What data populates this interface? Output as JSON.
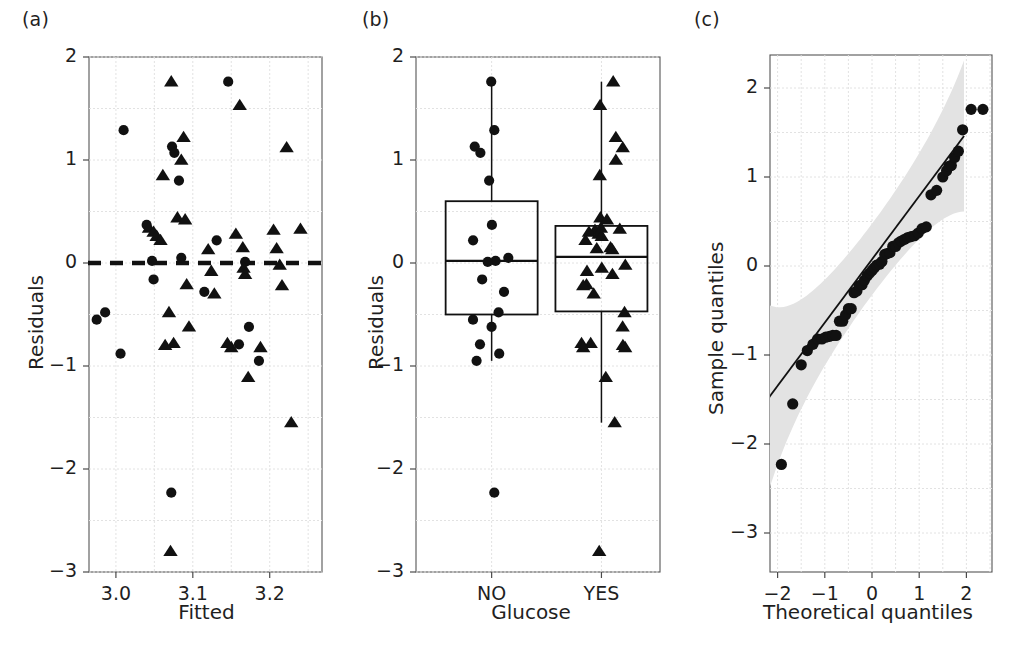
{
  "figure": {
    "background": "#ffffff",
    "marker_color": "#111111",
    "band_color": "#e3e3e3",
    "grid_color": "#e2e2e2",
    "axis_color": "#555555"
  },
  "panels": {
    "a": {
      "tag": "(a)",
      "xlabel": "Fitted",
      "ylabel": "Residuals"
    },
    "b": {
      "tag": "(b)",
      "xlabel": "Glucose",
      "ylabel": "Residuals"
    },
    "c": {
      "tag": "(c)",
      "xlabel": "Theoretical quantiles",
      "ylabel": "Sample quantiles"
    }
  },
  "chart_data": [
    {
      "id": "panel-a",
      "type": "scatter",
      "title": "(a)",
      "xlabel": "Fitted",
      "ylabel": "Residuals",
      "xlim": [
        2.965,
        3.268
      ],
      "ylim": [
        -3,
        2
      ],
      "xticks": [
        3.0,
        3.1,
        3.2
      ],
      "xtick_labels": [
        "3.0",
        "3.1",
        "3.2"
      ],
      "yticks": [
        -3,
        -2,
        -1,
        0,
        1,
        2
      ],
      "ytick_labels": [
        "-3",
        "-2",
        "-1",
        "0",
        "1",
        "2"
      ],
      "grid": true,
      "reference_line": {
        "type": "horizontal",
        "y": 0,
        "style": "dashed",
        "width": 4.5
      },
      "series": [
        {
          "name": "Glucose NO",
          "marker": "circle",
          "points": [
            [
              2.975,
              -0.55
            ],
            [
              2.986,
              -0.48
            ],
            [
              3.006,
              3.006
            ],
            [
              3.006,
              -0.88
            ],
            [
              3.01,
              1.29
            ],
            [
              3.04,
              0.37
            ],
            [
              3.047,
              0.02
            ],
            [
              3.049,
              -0.16
            ],
            [
              3.072,
              -2.23
            ],
            [
              3.073,
              1.13
            ],
            [
              3.076,
              1.07
            ],
            [
              3.082,
              0.8
            ],
            [
              3.085,
              0.05
            ],
            [
              3.115,
              -0.28
            ],
            [
              3.131,
              0.22
            ],
            [
              3.146,
              1.76
            ],
            [
              3.16,
              -0.79
            ],
            [
              3.168,
              0.01
            ],
            [
              3.173,
              -0.62
            ],
            [
              3.186,
              -0.95
            ]
          ]
        },
        {
          "name": "Glucose YES",
          "marker": "triangle",
          "points": [
            [
              3.043,
              0.34
            ],
            [
              3.049,
              0.3
            ],
            [
              3.053,
              0.26
            ],
            [
              3.058,
              0.22
            ],
            [
              3.061,
              0.85
            ],
            [
              3.064,
              -0.8
            ],
            [
              3.069,
              -0.48
            ],
            [
              3.071,
              -2.8
            ],
            [
              3.072,
              1.76
            ],
            [
              3.075,
              -0.78
            ],
            [
              3.08,
              0.44
            ],
            [
              3.085,
              1.0
            ],
            [
              3.088,
              1.22
            ],
            [
              3.09,
              0.42
            ],
            [
              3.092,
              -0.21
            ],
            [
              3.095,
              -0.62
            ],
            [
              3.12,
              0.13
            ],
            [
              3.124,
              -0.08
            ],
            [
              3.128,
              -0.3
            ],
            [
              3.145,
              -0.78
            ],
            [
              3.15,
              -0.82
            ],
            [
              3.156,
              0.28
            ],
            [
              3.161,
              1.53
            ],
            [
              3.165,
              0.15
            ],
            [
              3.166,
              -0.05
            ],
            [
              3.168,
              -0.11
            ],
            [
              3.172,
              -1.11
            ],
            [
              3.188,
              -0.82
            ],
            [
              3.205,
              0.32
            ],
            [
              3.209,
              0.14
            ],
            [
              3.213,
              -0.02
            ],
            [
              3.216,
              -0.22
            ],
            [
              3.222,
              1.12
            ],
            [
              3.228,
              -1.55
            ],
            [
              3.24,
              0.33
            ]
          ]
        }
      ]
    },
    {
      "id": "panel-b",
      "type": "boxplot",
      "title": "(b)",
      "xlabel": "Glucose",
      "ylabel": "Residuals",
      "ylim": [
        -3,
        2
      ],
      "yticks": [
        -3,
        -2,
        -1,
        0,
        1,
        2
      ],
      "ytick_labels": [
        "-3",
        "-2",
        "-1",
        "0",
        "1",
        "2"
      ],
      "categories": [
        "NO",
        "YES"
      ],
      "grid": true,
      "boxes": [
        {
          "category": "NO",
          "marker": "circle",
          "q1": -0.5,
          "median": 0.02,
          "q3": 0.6,
          "whisker_low": -0.95,
          "whisker_high": 1.76,
          "points": [
            1.76,
            1.29,
            1.13,
            1.07,
            0.8,
            0.37,
            0.22,
            0.05,
            0.02,
            0.01,
            -0.16,
            -0.28,
            -0.48,
            -0.55,
            -0.62,
            -0.79,
            -0.88,
            -0.95,
            -2.23
          ]
        },
        {
          "category": "YES",
          "marker": "triangle",
          "q1": -0.47,
          "median": 0.06,
          "q3": 0.36,
          "whisker_low": -1.55,
          "whisker_high": 1.76,
          "points": [
            1.76,
            1.53,
            1.22,
            1.12,
            1.0,
            0.85,
            0.44,
            0.42,
            0.34,
            0.33,
            0.32,
            0.3,
            0.28,
            0.26,
            0.22,
            0.15,
            0.14,
            0.13,
            -0.02,
            -0.05,
            -0.08,
            -0.11,
            -0.21,
            -0.22,
            -0.3,
            -0.48,
            -0.62,
            -0.78,
            -0.78,
            -0.8,
            -0.82,
            -0.82,
            -1.11,
            -1.55,
            -2.8
          ]
        }
      ]
    },
    {
      "id": "panel-c",
      "type": "scatter",
      "title": "(c)",
      "xlabel": "Theoretical quantiles",
      "ylabel": "Sample quantiles",
      "xlim": [
        -2.6,
        2.6
      ],
      "ylim": [
        -3,
        2.45
      ],
      "xticks": [
        -2,
        -1,
        0,
        1,
        2
      ],
      "xtick_labels": [
        "-2",
        "-1",
        "0",
        "1",
        "2"
      ],
      "yticks": [
        -3,
        -2,
        -1,
        0,
        1,
        2
      ],
      "ytick_labels": [
        "-3",
        "-2",
        "-1",
        "0",
        "1",
        "2"
      ],
      "grid": true,
      "qq_reference_line": {
        "x": [
          -2.3,
          1.95
        ],
        "y": [
          -1.56,
          1.46
        ]
      },
      "confidence_band": true,
      "series": [
        {
          "name": "Sample quantiles",
          "marker": "circle",
          "points": [
            [
              -2.35,
              -2.8
            ],
            [
              -1.92,
              -2.23
            ],
            [
              -1.68,
              -1.55
            ],
            [
              -1.5,
              -1.11
            ],
            [
              -1.37,
              -0.95
            ],
            [
              -1.25,
              -0.88
            ],
            [
              -1.15,
              -0.82
            ],
            [
              -1.06,
              -0.82
            ],
            [
              -0.98,
              -0.8
            ],
            [
              -0.9,
              -0.79
            ],
            [
              -0.83,
              -0.78
            ],
            [
              -0.76,
              -0.78
            ],
            [
              -0.69,
              -0.62
            ],
            [
              -0.62,
              -0.62
            ],
            [
              -0.56,
              -0.55
            ],
            [
              -0.5,
              -0.48
            ],
            [
              -0.44,
              -0.48
            ],
            [
              -0.38,
              -0.3
            ],
            [
              -0.32,
              -0.28
            ],
            [
              -0.27,
              -0.22
            ],
            [
              -0.21,
              -0.21
            ],
            [
              -0.16,
              -0.16
            ],
            [
              -0.1,
              -0.11
            ],
            [
              -0.05,
              -0.08
            ],
            [
              0.0,
              -0.05
            ],
            [
              0.05,
              -0.02
            ],
            [
              0.1,
              0.01
            ],
            [
              0.16,
              0.02
            ],
            [
              0.21,
              0.05
            ],
            [
              0.27,
              0.13
            ],
            [
              0.32,
              0.14
            ],
            [
              0.38,
              0.15
            ],
            [
              0.44,
              0.22
            ],
            [
              0.5,
              0.22
            ],
            [
              0.56,
              0.26
            ],
            [
              0.62,
              0.28
            ],
            [
              0.69,
              0.3
            ],
            [
              0.76,
              0.32
            ],
            [
              0.83,
              0.33
            ],
            [
              0.9,
              0.34
            ],
            [
              0.98,
              0.37
            ],
            [
              1.06,
              0.42
            ],
            [
              1.15,
              0.44
            ],
            [
              1.25,
              0.8
            ],
            [
              1.37,
              0.85
            ],
            [
              1.5,
              1.0
            ],
            [
              1.58,
              1.07
            ],
            [
              1.63,
              1.12
            ],
            [
              1.68,
              1.13
            ],
            [
              1.75,
              1.22
            ],
            [
              1.83,
              1.29
            ],
            [
              1.92,
              1.53
            ],
            [
              2.1,
              1.76
            ],
            [
              2.35,
              1.76
            ]
          ]
        }
      ]
    }
  ]
}
